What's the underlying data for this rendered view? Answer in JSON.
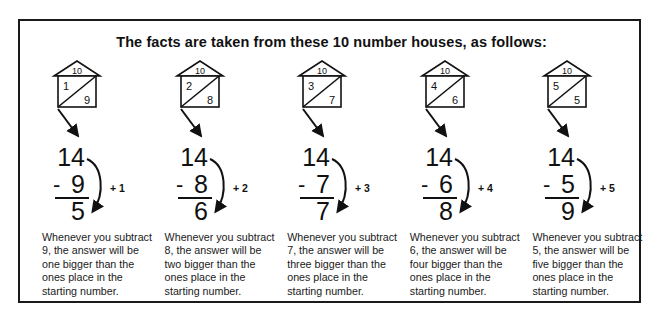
{
  "panel": {
    "title": "The facts are taken from these 10 number houses, as follows:"
  },
  "columns": [
    {
      "house": {
        "roof": "10",
        "left": "1",
        "right": "9"
      },
      "problem": {
        "minuend": "14",
        "operator": "-",
        "subtrahend": "9",
        "difference": "5",
        "annotation": "+ 1"
      },
      "caption": "Whenever you subtract 9, the answer will be one bigger than the ones place in the starting number."
    },
    {
      "house": {
        "roof": "10",
        "left": "2",
        "right": "8"
      },
      "problem": {
        "minuend": "14",
        "operator": "-",
        "subtrahend": "8",
        "difference": "6",
        "annotation": "+ 2"
      },
      "caption": "Whenever you subtract 8, the answer will be two bigger than the ones place in the starting number."
    },
    {
      "house": {
        "roof": "10",
        "left": "3",
        "right": "7"
      },
      "problem": {
        "minuend": "14",
        "operator": "-",
        "subtrahend": "7",
        "difference": "7",
        "annotation": "+ 3"
      },
      "caption": "Whenever you subtract 7, the answer will be three bigger than the ones place in the starting number."
    },
    {
      "house": {
        "roof": "10",
        "left": "4",
        "right": "6"
      },
      "problem": {
        "minuend": "14",
        "operator": "-",
        "subtrahend": "6",
        "difference": "8",
        "annotation": "+ 4"
      },
      "caption": "Whenever you subtract 6, the answer will be four bigger than the ones place in the starting number."
    },
    {
      "house": {
        "roof": "10",
        "left": "5",
        "right": "5"
      },
      "problem": {
        "minuend": "14",
        "operator": "-",
        "subtrahend": "5",
        "difference": "9",
        "annotation": "+ 5"
      },
      "caption": "Whenever you subtract 5, the answer will be five bigger than the ones place in the starting number."
    }
  ],
  "colors": {
    "ink": "#111111",
    "border": "#1a1a1a",
    "background": "#ffffff"
  }
}
